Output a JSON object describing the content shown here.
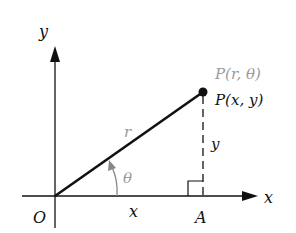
{
  "diagram": {
    "axes": {
      "x_label": "x",
      "y_label": "y",
      "origin_label": "O"
    },
    "point": {
      "polar_label": "P(r, θ)",
      "rect_label": "P(x, y)"
    },
    "segments": {
      "radius_label": "r",
      "x_length_label": "x",
      "y_length_label": "y"
    },
    "angle_label": "θ",
    "foot_label": "A",
    "colors": {
      "main": "#111111",
      "polar_label": "#9a9a9a",
      "angle_arrow": "#888888"
    }
  }
}
